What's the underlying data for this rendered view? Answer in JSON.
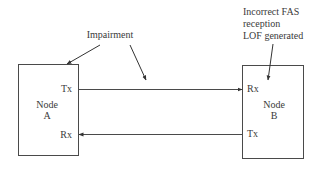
{
  "diagram": {
    "annotations": {
      "impairment": "Impairment",
      "node_b_note": [
        "Incorrect FAS",
        "reception",
        "LOF generated"
      ]
    },
    "nodes": [
      {
        "id": "A",
        "line1": "Node",
        "line2": "A",
        "ports": {
          "tx": "Tx",
          "rx": "Rx"
        }
      },
      {
        "id": "B",
        "line1": "Node",
        "line2": "B",
        "ports": {
          "tx": "Tx",
          "rx": "Rx"
        }
      }
    ],
    "links": [
      {
        "from": "A.Tx",
        "to": "B.Rx",
        "direction": "A-to-B"
      },
      {
        "from": "B.Tx",
        "to": "A.Rx",
        "direction": "B-to-A"
      }
    ],
    "colors": {
      "stroke": "#4a4a4a",
      "text": "#3a3a3a",
      "background": "#ffffff"
    }
  }
}
